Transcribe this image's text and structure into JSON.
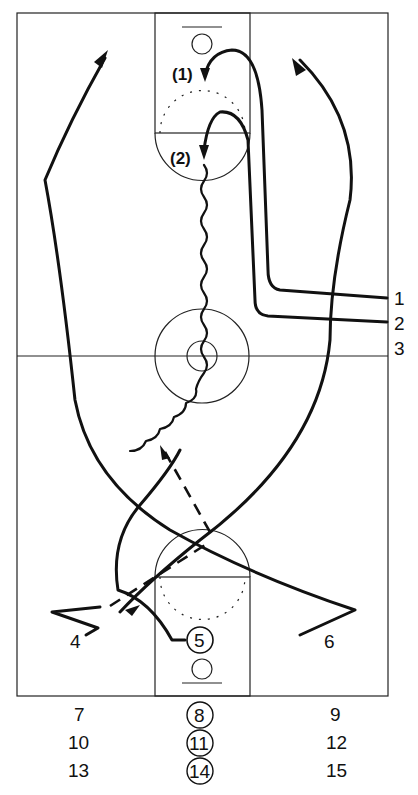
{
  "diagram": {
    "type": "basketball-drill",
    "line_color": "#111111",
    "background": "#ffffff",
    "spot_labels": {
      "spot1": "(1)",
      "spot2": "(2)"
    },
    "lane_labels": {
      "right_1": "1",
      "right_2": "2",
      "right_3": "3"
    },
    "players": {
      "p4": "4",
      "p5": "5",
      "p6": "6"
    },
    "waiting_lines": {
      "row1": {
        "left": "7",
        "center": "8",
        "right": "9"
      },
      "row2": {
        "left": "10",
        "center": "11",
        "right": "12"
      },
      "row3": {
        "left": "13",
        "center": "14",
        "right": "15"
      }
    }
  }
}
